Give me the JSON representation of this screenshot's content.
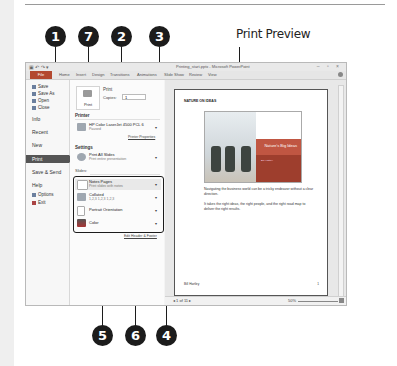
{
  "figure": {
    "preview_label": "Print Preview",
    "callouts": [
      "1",
      "7",
      "2",
      "3",
      "4",
      "5",
      "6"
    ]
  },
  "window": {
    "title": "Printing_start.pptx - Microsoft PowerPoint",
    "quick_access": "▣ ↶ ↷ ▾",
    "controls": "– ▫ ×",
    "tabs": [
      "File",
      "Home",
      "Insert",
      "Design",
      "Transitions",
      "Animations",
      "Slide Show",
      "Review",
      "View"
    ]
  },
  "backstage": {
    "items": [
      {
        "label": "Save",
        "icon": "save-icon"
      },
      {
        "label": "Save As",
        "icon": "save-as-icon"
      },
      {
        "label": "Open",
        "icon": "open-icon"
      },
      {
        "label": "Close",
        "icon": "close-icon"
      }
    ],
    "sections": [
      "Info",
      "Recent",
      "New",
      "Print",
      "Save & Send",
      "Help"
    ],
    "footer_items": [
      {
        "label": "Options",
        "icon": "options-icon"
      },
      {
        "label": "Exit",
        "icon": "exit-icon"
      }
    ],
    "selected": "Print"
  },
  "print_pane": {
    "print_button": "Print",
    "print_heading": "Print",
    "copies_label": "Copies:",
    "copies_value": "1",
    "printer_heading": "Printer",
    "printer_name": "HP Color LaserJet 4500 PCL 6",
    "printer_status": "Paused",
    "printer_properties": "Printer Properties",
    "settings_heading": "Settings",
    "slides_range": {
      "title": "Print All Slides",
      "subtitle": "Print entire presentation"
    },
    "slides_label": "Slides:",
    "layout": {
      "title": "Notes Pages",
      "subtitle": "Print slides with notes"
    },
    "collation": {
      "title": "Collated",
      "subtitle": "1,2,3   1,2,3   1,2,3"
    },
    "orientation": {
      "title": "Portrait Orientation",
      "subtitle": ""
    },
    "color": {
      "title": "Color",
      "subtitle": ""
    },
    "edit_header_footer": "Edit Header & Footer"
  },
  "preview": {
    "page_header": "NATURE ON IDEAS",
    "slide_title": "Nature's Big Ideas",
    "slide_subtitle": "Bill Hartley",
    "paragraph1": "Navigating the business world can be a tricky endeavor without a clear direction.",
    "paragraph2": "It takes the right ideas, the right people, and the right road map to deliver the right results.",
    "footer_left": "Bill Hartley",
    "footer_right": "1",
    "page_nav": "◂  1  of 11  ▸",
    "zoom_level": "50%"
  }
}
